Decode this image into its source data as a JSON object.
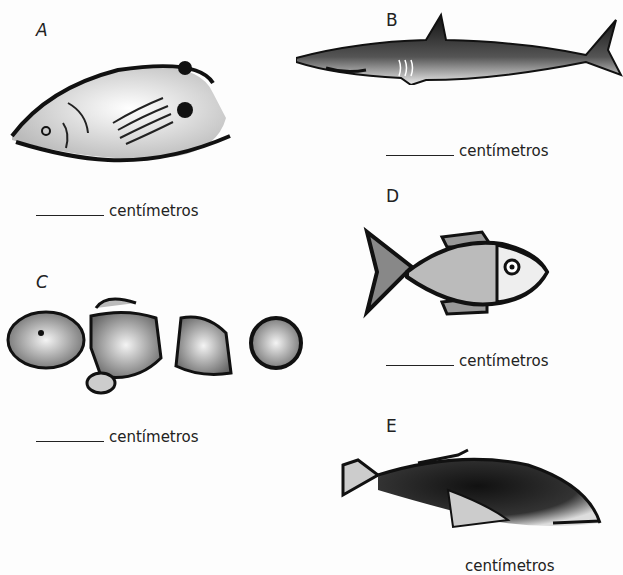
{
  "worksheet": {
    "items": [
      {
        "letter": "A",
        "label": "centímetros",
        "fish": "butterflyfish"
      },
      {
        "letter": "B",
        "label": "centímetros",
        "fish": "shark"
      },
      {
        "letter": "C",
        "label": "centímetros",
        "fish": "clownfish"
      },
      {
        "letter": "D",
        "label": "centímetros",
        "fish": "scaled-fish"
      },
      {
        "letter": "E",
        "label": "centímetros",
        "fish": "grouper"
      }
    ]
  }
}
